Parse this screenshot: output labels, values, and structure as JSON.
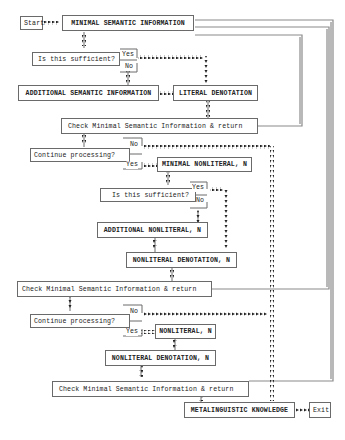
{
  "diagram": {
    "start": "Start",
    "exit": "Exit",
    "boxes": {
      "minimal_semantic": "MINIMAL SEMANTIC INFORMATION",
      "additional_semantic": "ADDITIONAL SEMANTIC INFORMATION",
      "literal_denotation": "LITERAL DENOTATION",
      "check1": "Check Minimal Semantic Information & return",
      "minimal_nonliteral": "MINIMAL NONLITERAL, N",
      "additional_nonliteral": "ADDITIONAL NONLITERAL, N",
      "nonliteral_denotation_1": "NONLITERAL DENOTATION, N",
      "check2": "Check Minimal Semantic Information & return",
      "nonliteral": "NONLITERAL, N",
      "nonliteral_denotation_2": "NONLITERAL DENOTATION, N",
      "check3": "Check Minimal Semantic Information & return",
      "metalinguistic": "METALINGUISTIC KNOWLEDGE"
    },
    "decisions": {
      "sufficient_1": "Is this sufficient?",
      "continue_1": "Continue processing?",
      "sufficient_2": "Is this sufficient?",
      "continue_2": "Continue processing?"
    },
    "branch_labels": {
      "yes": "Yes",
      "no": "No"
    },
    "colors": {
      "line": "#6a6a6a",
      "dotted_arrow": "#222222",
      "return_line": "#8a8a8a"
    }
  }
}
